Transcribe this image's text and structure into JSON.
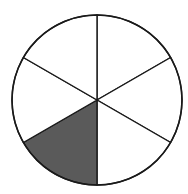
{
  "diagram": {
    "type": "fraction-circle",
    "total_parts": 6,
    "shaded_parts": 1,
    "fraction_shown": "1/6",
    "center": [
      97,
      100
    ],
    "radius": 85,
    "spoke_start_angle_deg": 0,
    "shaded_sector_index": 3,
    "colors": {
      "background": "#ffffff",
      "stroke": "#1a1a1a",
      "shaded_fill": "#5a5a5a",
      "unshaded_fill": "#ffffff"
    }
  }
}
